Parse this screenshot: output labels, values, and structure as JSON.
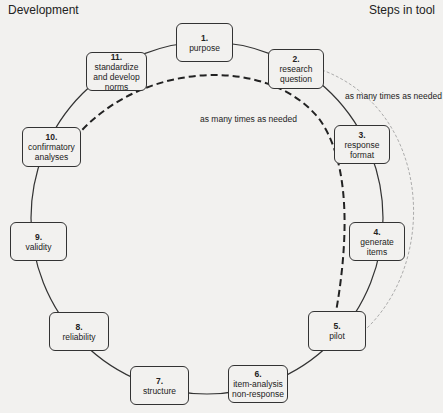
{
  "header": {
    "left": "Development",
    "right": "Steps in tool"
  },
  "steps": [
    {
      "num": "1.",
      "label": "purpose"
    },
    {
      "num": "2.",
      "label": "research question"
    },
    {
      "num": "3.",
      "label": "response format"
    },
    {
      "num": "4.",
      "label": "generate items"
    },
    {
      "num": "5.",
      "label": "pilot"
    },
    {
      "num": "6.",
      "label": "item-analysis non-response"
    },
    {
      "num": "7.",
      "label": "structure"
    },
    {
      "num": "8.",
      "label": "reliability"
    },
    {
      "num": "9.",
      "label": "validity"
    },
    {
      "num": "10.",
      "label": "confirmatory analyses"
    },
    {
      "num": "11.",
      "label": "standardize and develop norms"
    }
  ],
  "annotations": {
    "inner_loop": "as many times as needed",
    "outer_loop": "as many times as needed"
  },
  "colors": {
    "background": "#f2f1ef",
    "stroke": "#333333"
  }
}
